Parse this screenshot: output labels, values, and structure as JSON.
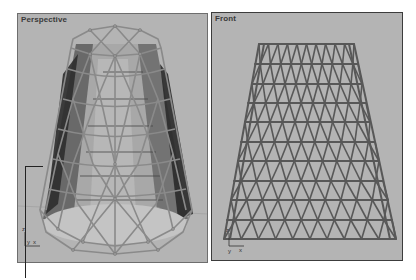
{
  "viewports": [
    {
      "id": "perspective",
      "label": "Perspective",
      "active": false,
      "axes": {
        "z": "z",
        "y": "y",
        "x": "x"
      },
      "content": "geodesic-cone-wireframe-shaded"
    },
    {
      "id": "front",
      "label": "Front",
      "active": true,
      "axes": {
        "z": "z",
        "y": "y",
        "x": "x"
      },
      "content": "geodesic-cone-wireframe"
    }
  ],
  "colors": {
    "viewport_bg": "#b4b4b4",
    "wire_front": "#5a5a5a",
    "wire_persp": "#8c8c8c",
    "shade_dark": "#3a3a3a",
    "active_border": "#3c3c3c"
  }
}
